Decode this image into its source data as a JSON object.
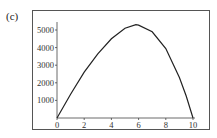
{
  "panel_label": "(c)",
  "chart_data": {
    "type": "line",
    "title": "",
    "xlabel": "",
    "ylabel": "",
    "xlim": [
      0,
      10
    ],
    "ylim": [
      0,
      5500
    ],
    "x_ticks": [
      "0",
      "2",
      "4",
      "6",
      "8",
      "10"
    ],
    "y_ticks": [
      "1000",
      "2000",
      "3000",
      "4000",
      "5000"
    ],
    "grid": false,
    "legend": null,
    "series": [
      {
        "name": "curve",
        "x": [
          0,
          1,
          2,
          3,
          4,
          5,
          5.8,
          6,
          7,
          8,
          9,
          9.5,
          10
        ],
        "y": [
          0,
          1350,
          2600,
          3650,
          4500,
          5100,
          5300,
          5280,
          4900,
          3950,
          2300,
          1250,
          0
        ]
      }
    ]
  }
}
